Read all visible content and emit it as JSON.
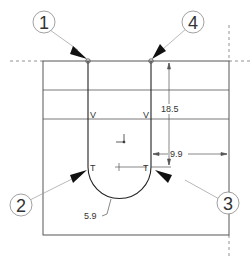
{
  "drawing": {
    "callouts": [
      {
        "id": "1",
        "label": "1"
      },
      {
        "id": "2",
        "label": "2"
      },
      {
        "id": "3",
        "label": "3"
      },
      {
        "id": "4",
        "label": "4"
      }
    ],
    "markers": {
      "v_left": "V",
      "v_right": "V",
      "t_left": "T",
      "t_right": "T"
    },
    "dimensions": {
      "height": "18.5",
      "offset": "9.9",
      "radius": "5.9"
    },
    "colors": {
      "line": "#333333",
      "construction": "#777777",
      "arrow": "#111111"
    }
  }
}
